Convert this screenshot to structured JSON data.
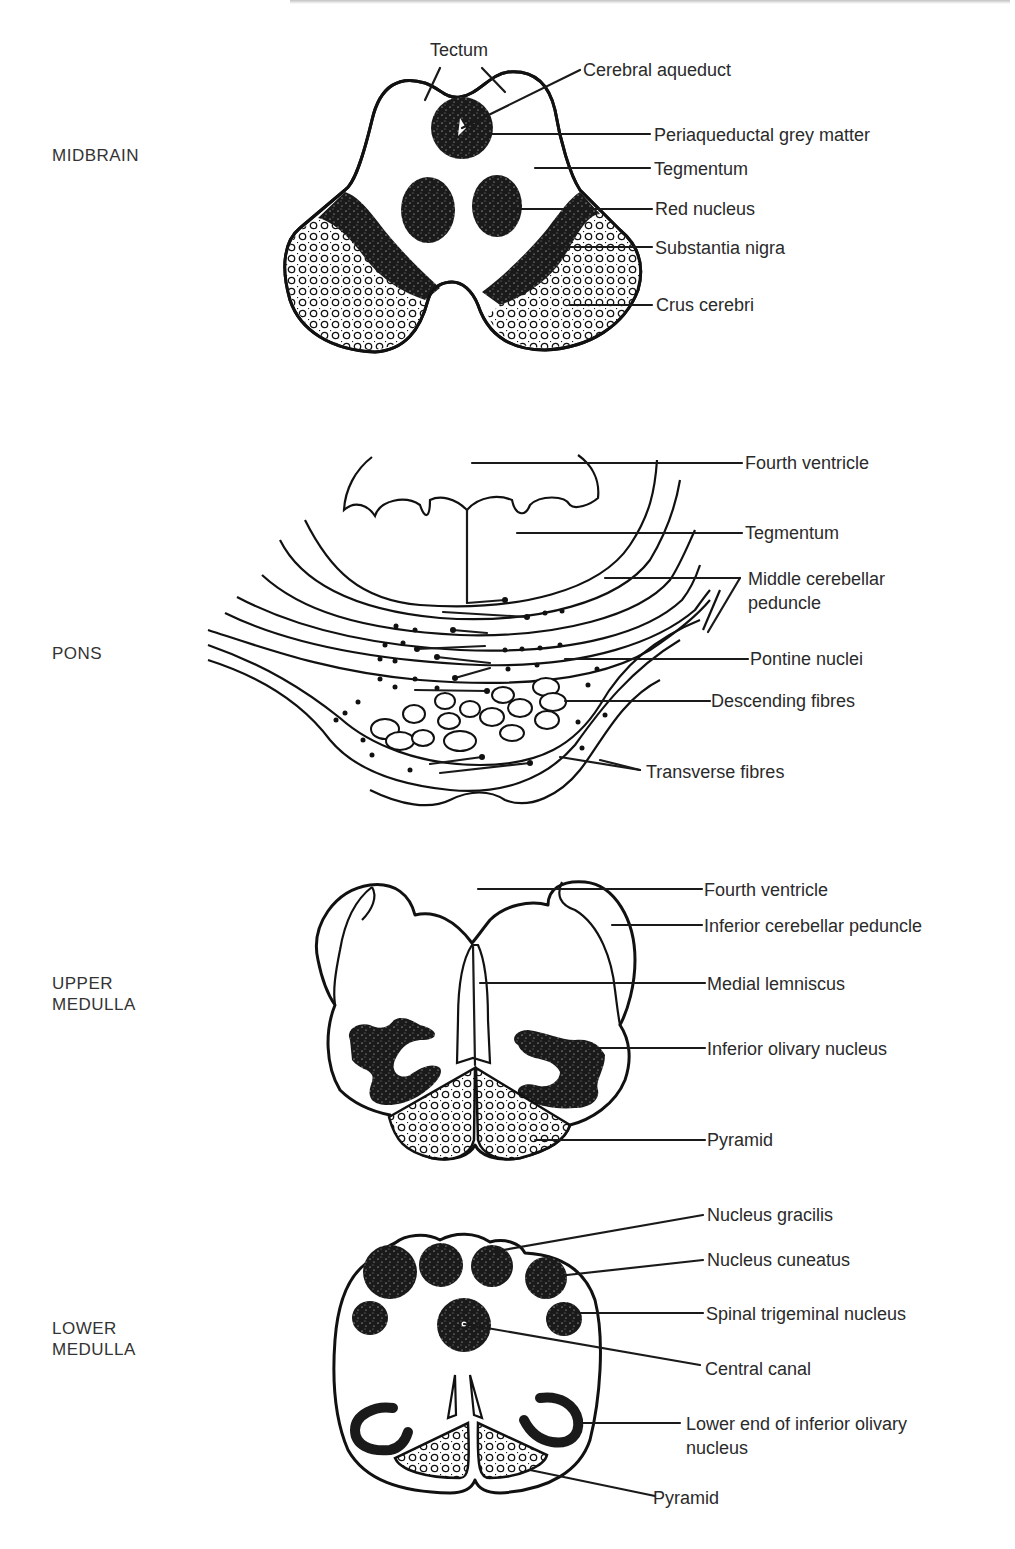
{
  "page": {
    "cropped_header_visible": true
  },
  "colors": {
    "ink": "#1a1a1a",
    "text": "#2a2a2a",
    "background": "#ffffff"
  },
  "sections": [
    {
      "id": "midbrain",
      "title": "MIDBRAIN",
      "labels": {
        "tectum": "Tectum",
        "cerebral_aqueduct": "Cerebral aqueduct",
        "periaqueductal": "Periaqueductal grey matter",
        "tegmentum": "Tegmentum",
        "red_nucleus": "Red nucleus",
        "substantia_nigra": "Substantia nigra",
        "crus_cerebri": "Crus cerebri"
      }
    },
    {
      "id": "pons",
      "title": "PONS",
      "labels": {
        "fourth_ventricle": "Fourth ventricle",
        "tegmentum": "Tegmentum",
        "middle_cerebellar_peduncle_1": "Middle cerebellar",
        "middle_cerebellar_peduncle_2": "peduncle",
        "pontine_nuclei": "Pontine nuclei",
        "descending_fibres": "Descending fibres",
        "transverse_fibres": "Transverse fibres"
      }
    },
    {
      "id": "upper-medulla",
      "title": "UPPER\nMEDULLA",
      "labels": {
        "fourth_ventricle": "Fourth ventricle",
        "inferior_cerebellar_peduncle": "Inferior cerebellar peduncle",
        "medial_lemniscus": "Medial lemniscus",
        "inferior_olivary_nucleus": "Inferior olivary nucleus",
        "pyramid": "Pyramid"
      }
    },
    {
      "id": "lower-medulla",
      "title": "LOWER\nMEDULLA",
      "labels": {
        "nucleus_gracilis": "Nucleus gracilis",
        "nucleus_cuneatus": "Nucleus cuneatus",
        "spinal_trigeminal_nucleus": "Spinal trigeminal nucleus",
        "central_canal": "Central canal",
        "lower_end_olivary_1": "Lower end of inferior olivary",
        "lower_end_olivary_2": "nucleus",
        "pyramid": "Pyramid"
      }
    }
  ]
}
